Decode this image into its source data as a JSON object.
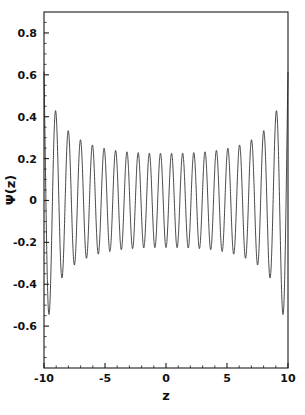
{
  "chart_data": {
    "type": "line",
    "title": "",
    "xlabel": "z",
    "ylabel": "Ψ(z)",
    "xlim": [
      -10,
      10
    ],
    "ylim": [
      -0.8,
      0.9
    ],
    "grid": false,
    "legend": null,
    "xticks": [
      -10,
      -5,
      0,
      5,
      10
    ],
    "xtick_labels": [
      "-10",
      "-5",
      "0",
      "5",
      "10"
    ],
    "yticks": [
      0.8,
      0.6,
      0.4,
      0.2,
      0,
      -0.2,
      -0.4,
      -0.6
    ],
    "ytick_labels": [
      "0.8",
      "0.6",
      "0.4",
      "0.2",
      "0",
      "-0.2",
      "-0.4",
      "-0.6"
    ],
    "x_minor_tick_step": 1,
    "y_minor_tick_step": 0.05,
    "line_color": "#1a1a1a",
    "line_width": 0.8,
    "frame_color": "#1a1a1a",
    "background": "#ffffff",
    "series": [
      {
        "name": "Ψ(z)",
        "model": "wkb_envelope_cosine",
        "envelope_center_amplitude": 0.225,
        "envelope_edge_amplitude": 0.78,
        "oscillation_count": 22,
        "x_sample_count": 2400
      }
    ],
    "annotated_extrema": {
      "peak_positions_z": [
        -9.99,
        -8.45,
        -7.22,
        -6.08,
        -4.62,
        -3.45,
        -2.25,
        -1.1,
        0.0,
        1.1,
        2.25,
        3.45,
        4.62,
        6.08,
        7.22,
        8.45,
        9.95
      ],
      "peak_values": [
        0.78,
        0.65,
        0.52,
        0.4,
        0.32,
        0.25,
        0.21,
        0.19,
        0.19,
        0.19,
        0.21,
        0.25,
        0.32,
        0.4,
        0.52,
        0.66,
        0.74
      ],
      "trough_values": [
        -0.75,
        -0.58,
        -0.45,
        -0.35,
        -0.28,
        -0.23,
        -0.21,
        -0.2,
        -0.2,
        -0.21,
        -0.23,
        -0.28,
        -0.35,
        -0.45,
        -0.58,
        -0.76
      ]
    },
    "axes_geometry": {
      "frame_left_px": 44,
      "frame_right_px": 288,
      "frame_top_px": 12,
      "frame_bottom_px": 368
    }
  }
}
